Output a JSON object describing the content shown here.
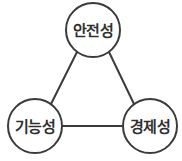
{
  "diagram": {
    "type": "triangle-concept-diagram",
    "background_color": "#ffffff",
    "stroke_color": "#3b3b3b",
    "text_color": "#2f2f2f",
    "nodes": [
      {
        "id": "safety",
        "label": "안전성",
        "position": "top",
        "cx": 93,
        "cy": 30,
        "r": 27
      },
      {
        "id": "functionality",
        "label": "기능성",
        "position": "bottom-left",
        "cx": 35,
        "cy": 126,
        "r": 27
      },
      {
        "id": "economy",
        "label": "경제성",
        "position": "bottom-right",
        "cx": 150,
        "cy": 126,
        "r": 27
      }
    ],
    "edges": [
      {
        "id": "safety-functionality",
        "from": "safety",
        "to": "functionality",
        "x1": 77,
        "y1": 52,
        "x2": 51,
        "y2": 104
      },
      {
        "id": "safety-economy",
        "from": "safety",
        "to": "economy",
        "x1": 109,
        "y1": 52,
        "x2": 134,
        "y2": 104
      },
      {
        "id": "functionality-economy",
        "from": "functionality",
        "to": "economy",
        "x1": 62,
        "y1": 126,
        "x2": 123,
        "y2": 126
      }
    ]
  }
}
